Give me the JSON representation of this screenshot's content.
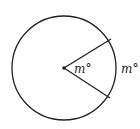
{
  "diagram": {
    "type": "circle-central-angle",
    "circle": {
      "cx": 64,
      "cy": 68,
      "r": 52,
      "stroke": "#222222"
    },
    "center_point": {
      "x": 64,
      "y": 68
    },
    "radii": [
      {
        "x2": 111,
        "y2": 39
      },
      {
        "x2": 110,
        "y2": 98
      }
    ],
    "labels": {
      "central_angle": "m°",
      "arc": "m°"
    }
  }
}
